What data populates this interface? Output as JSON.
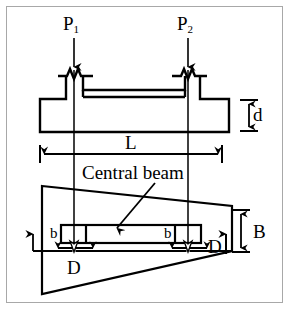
{
  "figure": {
    "border_color": "#a8a8a8",
    "line_color": "#000000",
    "background": "#ffffff"
  },
  "labels": {
    "load_left_symbol": "P",
    "load_left_subscript": "1",
    "load_right_symbol": "P",
    "load_right_subscript": "2",
    "span_length": "L",
    "thickness_d": "d",
    "width_B": "B",
    "callout_central_beam": "Central beam",
    "beam_width_left": "b",
    "beam_width_right": "b",
    "spacing_left": "D",
    "spacing_right": "D"
  },
  "annotations": {
    "arrows": [
      {
        "name": "load-arrow-left",
        "label": "P1",
        "direction": "down"
      },
      {
        "name": "load-arrow-right",
        "label": "P2",
        "direction": "down"
      },
      {
        "name": "span-dimension-arrow",
        "label": "L",
        "direction": "horizontal-double"
      },
      {
        "name": "thickness-dimension-arrow",
        "label": "d",
        "direction": "vertical-double"
      },
      {
        "name": "width-dimension-arrow",
        "label": "B",
        "direction": "vertical-double"
      },
      {
        "name": "spacing-arrow-left",
        "label": "D",
        "direction": "horizontal-double"
      },
      {
        "name": "spacing-arrow-right",
        "label": "D",
        "direction": "horizontal-double"
      },
      {
        "name": "reaction-arrow-left",
        "label": "",
        "direction": "up"
      },
      {
        "name": "reaction-arrow-right",
        "label": "",
        "direction": "up"
      },
      {
        "name": "central-beam-leader-arrow",
        "label": "Central beam",
        "direction": "diagonal-down-left"
      }
    ]
  }
}
